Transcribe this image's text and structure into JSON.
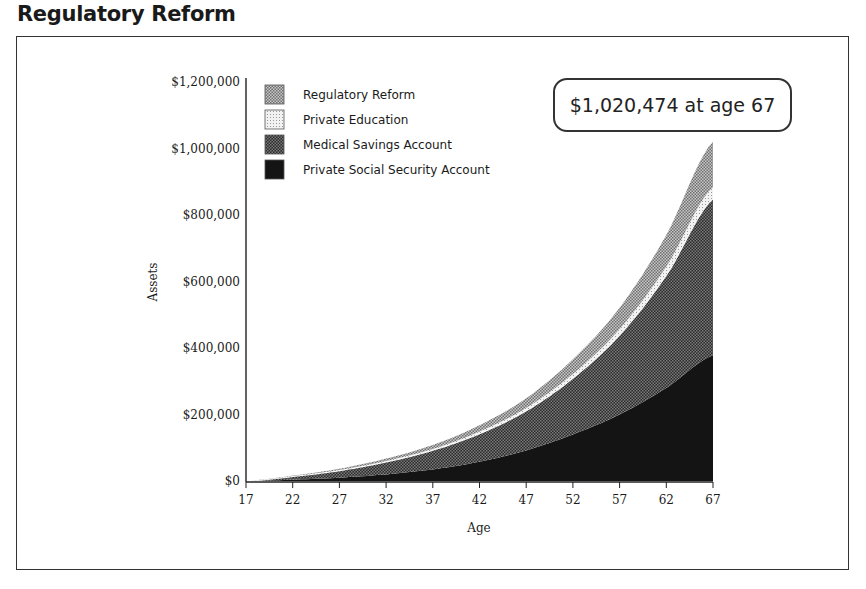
{
  "page": {
    "title": "Regulatory Reform"
  },
  "callout": {
    "text": "$1,020,474 at age 67"
  },
  "colors": {
    "regulatory_reform": "#9a9a9a",
    "private_education": "#dcdcdc",
    "medical_savings": "#4a4a4a",
    "private_social_security": "#141414",
    "axis": "#222222",
    "frame": "#333333"
  },
  "chart_data": {
    "type": "area",
    "stacked": true,
    "title": "Regulatory Reform",
    "xlabel": "Age",
    "ylabel": "Assets",
    "x": [
      17,
      22,
      27,
      32,
      37,
      42,
      47,
      52,
      57,
      62,
      67
    ],
    "x_tick_labels": [
      "17",
      "22",
      "27",
      "32",
      "37",
      "42",
      "47",
      "52",
      "57",
      "62",
      "67"
    ],
    "y_tick_values": [
      0,
      200000,
      400000,
      600000,
      800000,
      1000000,
      1200000
    ],
    "y_tick_labels": [
      "$0",
      "$200,000",
      "$400,000",
      "$600,000",
      "$800,000",
      "$1,000,000",
      "$1,200,000"
    ],
    "ylim": [
      0,
      1200000
    ],
    "xlim": [
      17,
      67
    ],
    "grid": false,
    "legend_position": "top-left inside plot",
    "series": [
      {
        "name": "Private Social Security Account",
        "values": [
          0,
          4000,
          10000,
          20000,
          35000,
          58000,
          92000,
          140000,
          200000,
          280000,
          378000
        ]
      },
      {
        "name": "Medical Savings Account",
        "values": [
          0,
          10000,
          22000,
          38000,
          58000,
          85000,
          120000,
          170000,
          240000,
          340000,
          472000
        ]
      },
      {
        "name": "Private Education",
        "values": [
          0,
          600,
          1300,
          2300,
          3500,
          5500,
          8000,
          12000,
          17000,
          25000,
          34000
        ]
      },
      {
        "name": "Regulatory Reform",
        "values": [
          0,
          1500,
          3500,
          7000,
          12000,
          19000,
          29000,
          44000,
          64000,
          95000,
          136474
        ]
      }
    ],
    "annotations": [
      {
        "text": "$1,020,474 at age 67",
        "x": 67,
        "y": 1020474
      }
    ],
    "legend": [
      "Regulatory Reform",
      "Private Education",
      "Medical Savings Account",
      "Private Social Security Account"
    ]
  }
}
